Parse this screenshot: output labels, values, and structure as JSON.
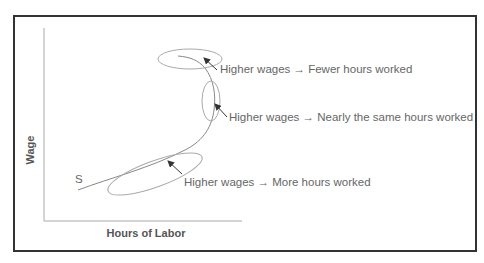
{
  "diagram": {
    "axes": {
      "y_label": "Wage",
      "x_label": "Hours of Labor"
    },
    "curve": {
      "name": "S",
      "label": "S"
    },
    "annotations": [
      {
        "region": "top",
        "text": "Higher wages → Fewer hours worked"
      },
      {
        "region": "middle",
        "text": "Higher wages → Nearly the same hours worked"
      },
      {
        "region": "bottom",
        "text": "Higher wages → More hours worked"
      }
    ],
    "colors": {
      "frame": "#333333",
      "axis": "#999999",
      "curve": "#888888",
      "ellipse": "#aaaaaa",
      "arrow": "#333333",
      "text": "#666666"
    }
  }
}
